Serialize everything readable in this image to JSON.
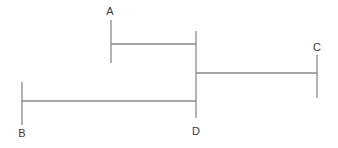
{
  "diagram": {
    "type": "bracket-line-diagram",
    "background_color": "#ffffff",
    "line_color": "#8a8a8a",
    "label_color": "#3a3a3a",
    "line_width": 1.3,
    "canvas": {
      "width": 338,
      "height": 148
    },
    "nodes": [
      {
        "id": "A",
        "label": "A",
        "label_x": 110,
        "label_y": 11,
        "tick_x": 111,
        "tick_y1": 20,
        "tick_y2": 63,
        "connector_y": 44
      },
      {
        "id": "B",
        "label": "B",
        "label_x": 22,
        "label_y": 133,
        "tick_x": 22,
        "tick_y1": 82,
        "tick_y2": 125,
        "connector_y": 101
      },
      {
        "id": "C",
        "label": "C",
        "label_x": 317,
        "label_y": 47,
        "tick_x": 317,
        "tick_y1": 55,
        "tick_y2": 98,
        "connector_y": 73
      },
      {
        "id": "D",
        "label": "D",
        "label_x": 196,
        "label_y": 131,
        "tick_x": 196,
        "tick_y1": 31,
        "tick_y2": 118,
        "connector_y": 73
      }
    ],
    "connectors": [
      {
        "id": "A-D",
        "from": "A",
        "to": "D",
        "x1": 111,
        "x2": 196,
        "y": 44
      },
      {
        "id": "D-C",
        "from": "D",
        "to": "C",
        "x1": 196,
        "x2": 317,
        "y": 73
      },
      {
        "id": "B-D",
        "from": "B",
        "to": "D",
        "x1": 22,
        "x2": 196,
        "y": 101
      }
    ]
  }
}
